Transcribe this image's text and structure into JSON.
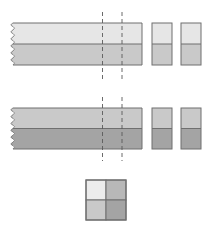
{
  "diagram": {
    "colors": {
      "border": "#6f6f6f",
      "dash": "#5a5a5a",
      "very_light": "#ececec",
      "light": "#e6e6e6",
      "medium": "#c9c9c9",
      "medium_dark": "#b8b8b8",
      "dark": "#a4a4a4"
    },
    "rows": [
      {
        "name": "row-1",
        "strip": {
          "x": 13,
          "y": 23,
          "width": 129,
          "height": 42,
          "top_fill": "light",
          "bottom_fill": "medium"
        },
        "dashed_lines_x": [
          102.5,
          122
        ],
        "dash_y": [
          12,
          80
        ],
        "blocks": [
          {
            "x": 152,
            "y": 23,
            "width": 20,
            "height": 42,
            "top_fill": "light",
            "bottom_fill": "medium"
          },
          {
            "x": 181,
            "y": 23,
            "width": 20,
            "height": 42,
            "top_fill": "light",
            "bottom_fill": "medium"
          }
        ]
      },
      {
        "name": "row-2",
        "strip": {
          "x": 13,
          "y": 108,
          "width": 129,
          "height": 41,
          "top_fill": "medium",
          "bottom_fill": "dark"
        },
        "dashed_lines_x": [
          102.5,
          122
        ],
        "dash_y": [
          97,
          161
        ],
        "blocks": [
          {
            "x": 152,
            "y": 108,
            "width": 20,
            "height": 41,
            "top_fill": "medium",
            "bottom_fill": "dark"
          },
          {
            "x": 181,
            "y": 108,
            "width": 20,
            "height": 41,
            "top_fill": "medium",
            "bottom_fill": "dark"
          }
        ]
      }
    ],
    "grid_square": {
      "x": 86,
      "y": 180,
      "size": 40,
      "cells": [
        {
          "pos": "top-left",
          "fill": "very_light"
        },
        {
          "pos": "top-right",
          "fill": "medium_dark"
        },
        {
          "pos": "bottom-left",
          "fill": "medium"
        },
        {
          "pos": "bottom-right",
          "fill": "dark"
        }
      ]
    }
  }
}
